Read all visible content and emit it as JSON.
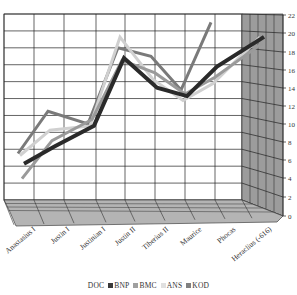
{
  "chart_data": {
    "type": "line",
    "style": "3d-line",
    "title": "",
    "xlabel": "",
    "ylabel": "",
    "categories": [
      "Anastasius I",
      "Justin I",
      "Justinian I",
      "Justin II",
      "Tiberius II",
      "Maurice",
      "Phocas",
      "Heraclius (-616)"
    ],
    "ylim": [
      0,
      22
    ],
    "yticks": [
      0,
      2,
      4,
      6,
      8,
      10,
      12,
      14,
      16,
      18,
      20,
      22
    ],
    "grid": true,
    "legend_position": "bottom",
    "series": [
      {
        "name": "DOC",
        "color": "#ffffff",
        "values": [
          null,
          null,
          null,
          null,
          null,
          null,
          null,
          null
        ]
      },
      {
        "name": "BNP",
        "color": "#2a2a2a",
        "values": [
          5,
          7,
          9.5,
          17.5,
          14,
          13,
          16.5,
          20
        ]
      },
      {
        "name": "BMC",
        "color": "#9a9a9a",
        "values": [
          3,
          7.5,
          10,
          17,
          15.5,
          13,
          15,
          19
        ]
      },
      {
        "name": "ANS",
        "color": "#d0d0d0",
        "values": [
          5.5,
          8.5,
          9,
          19.5,
          14.5,
          12,
          14,
          19.5
        ]
      },
      {
        "name": "KOD",
        "color": "#7a7a7a",
        "values": [
          5.5,
          10.5,
          9,
          18,
          17,
          13,
          21,
          null
        ]
      }
    ]
  },
  "axis": {
    "y_labels": [
      "0",
      "2",
      "4",
      "6",
      "8",
      "10",
      "12",
      "14",
      "16",
      "18",
      "20",
      "22"
    ]
  },
  "legend": {
    "items": [
      {
        "label": "DOC",
        "color": "#ffffff"
      },
      {
        "label": "BNP",
        "color": "#3a3a3a"
      },
      {
        "label": "BMC",
        "color": "#a0a0a0"
      },
      {
        "label": "ANS",
        "color": "#e0e0e0"
      },
      {
        "label": "KOD",
        "color": "#808080"
      }
    ]
  }
}
